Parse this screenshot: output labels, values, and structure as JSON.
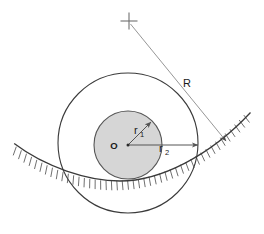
{
  "figure": {
    "background_color": "#ffffff",
    "width": 264,
    "height": 234
  },
  "labels": {
    "center": "O",
    "inner_radius_base": "r",
    "inner_radius_sub": "1",
    "outer_radius_base": "r",
    "outer_radius_sub": "2",
    "surface_radius": "R"
  },
  "colors": {
    "stroke": "#3a3a3a",
    "inner_fill": "#d4d4d4",
    "inner_stroke": "#555555",
    "hatch": "#4a4a4a",
    "leader": "#8a8a8a",
    "text": "#1a1a1a"
  },
  "geometry": {
    "center": {
      "x": 128,
      "y": 145
    },
    "inner_circle": {
      "cx": 128,
      "cy": 145,
      "r": 34
    },
    "outer_circle": {
      "cx": 128,
      "cy": 143,
      "r": 70
    },
    "curvature_center_mark": {
      "x": 129,
      "y": 21
    },
    "radius_arrow_tip": {
      "x": 227,
      "y": 142
    },
    "r1_arrow_tip": {
      "x": 152,
      "y": 121
    },
    "r2_arrow_tip": {
      "x": 199,
      "y": 146
    },
    "surface_arc": {
      "left_x": 14,
      "left_y": 146,
      "right_x": 250,
      "right_y": 127,
      "low_y": 178
    }
  },
  "label_positions": {
    "center": {
      "x": 117,
      "y": 149
    },
    "r1": {
      "x": 136,
      "y": 132
    },
    "r2": {
      "x": 161,
      "y": 151
    },
    "R": {
      "x": 186,
      "y": 84
    }
  }
}
